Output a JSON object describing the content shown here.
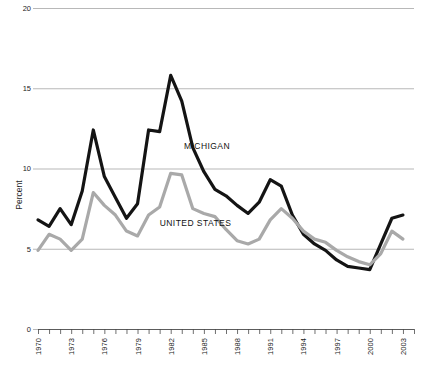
{
  "chart_data": {
    "type": "line",
    "title": "",
    "xlabel": "",
    "ylabel": "Percent",
    "ylim": [
      0,
      20
    ],
    "xlim": [
      1970,
      2004
    ],
    "grid": true,
    "y_ticks": [
      0,
      5,
      10,
      15,
      20
    ],
    "y_tick_labels": [
      "0",
      "5",
      "10",
      "15",
      "20"
    ],
    "x_tick_labels": [
      "1970",
      "1973",
      "1976",
      "1979",
      "1982",
      "1985",
      "1988",
      "1991",
      "1994",
      "1997",
      "2000",
      "2003"
    ],
    "x_tick_label_years": [
      1970,
      1973,
      1976,
      1979,
      1982,
      1985,
      1988,
      1991,
      1994,
      1997,
      2000,
      2003
    ],
    "x_minor_tick_years": [
      1970,
      1971,
      1972,
      1973,
      1974,
      1975,
      1976,
      1977,
      1978,
      1979,
      1980,
      1981,
      1982,
      1983,
      1984,
      1985,
      1986,
      1987,
      1988,
      1989,
      1990,
      1991,
      1992,
      1993,
      1994,
      1995,
      1996,
      1997,
      1998,
      1999,
      2000,
      2001,
      2002,
      2003,
      2004
    ],
    "x": [
      1970,
      1971,
      1972,
      1973,
      1974,
      1975,
      1976,
      1977,
      1978,
      1979,
      1980,
      1981,
      1982,
      1983,
      1984,
      1985,
      1986,
      1987,
      1988,
      1989,
      1990,
      1991,
      1992,
      1993,
      1994,
      1995,
      1996,
      1997,
      1998,
      1999,
      2000,
      2001,
      2002,
      2003
    ],
    "legend_position": "inline-annotation",
    "series": [
      {
        "name": "MICHIGAN",
        "color": "#141414",
        "stroke_width": 3.2,
        "label_x": 1983.2,
        "label_y": 11.2,
        "values": [
          6.8,
          6.4,
          7.5,
          6.5,
          8.6,
          12.4,
          9.5,
          8.2,
          6.9,
          7.8,
          12.4,
          12.3,
          15.8,
          14.2,
          11.3,
          9.8,
          8.7,
          8.3,
          7.7,
          7.2,
          7.9,
          9.3,
          8.9,
          7.1,
          5.9,
          5.3,
          4.9,
          4.3,
          3.9,
          3.8,
          3.7,
          5.3,
          6.9,
          7.1
        ]
      },
      {
        "name": "UNITED STATES",
        "color": "#a9a9a9",
        "stroke_width": 3.2,
        "label_x": 1981.0,
        "label_y": 6.4,
        "values": [
          4.9,
          5.9,
          5.6,
          4.9,
          5.6,
          8.5,
          7.7,
          7.1,
          6.1,
          5.8,
          7.1,
          7.6,
          9.7,
          9.6,
          7.5,
          7.2,
          7.0,
          6.2,
          5.5,
          5.3,
          5.6,
          6.8,
          7.5,
          6.9,
          6.1,
          5.6,
          5.4,
          4.9,
          4.5,
          4.2,
          4.0,
          4.7,
          6.1,
          5.6
        ]
      }
    ]
  },
  "axis": {
    "y_title": "Percent"
  }
}
